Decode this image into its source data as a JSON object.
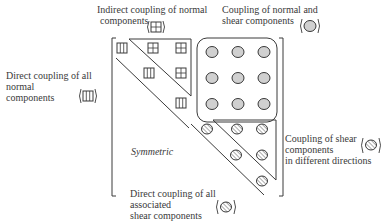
{
  "labels": {
    "indirect_normal": [
      "Indirect coupling of normal",
      "components"
    ],
    "normal_shear": [
      "Coupling of normal and",
      "shear components"
    ],
    "direct_normal": [
      "Direct coupling of all",
      "normal",
      "components"
    ],
    "shear_directions": [
      "Coupling of shear",
      "components",
      "in different directions"
    ],
    "direct_shear": [
      "Direct coupling of all",
      "associated",
      "shear components"
    ],
    "symmetric": "Symmetric"
  },
  "legend_icons": {
    "direct_normal": "square-vertical-lines-icon",
    "indirect_normal": "square-cross-icon",
    "normal_shear": "filled-circle-icon",
    "shear_directions": "hatched-circle-icon",
    "direct_shear": "hatched-circle-icon"
  },
  "colors": {
    "line": "#3a3a3a",
    "circle_fill": "#d0d0d0",
    "hatch": "#555555"
  }
}
